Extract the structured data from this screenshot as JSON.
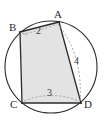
{
  "figure": {
    "type": "geometry-diagram",
    "canvas": {
      "width": 107,
      "height": 131
    },
    "colors": {
      "stroke": "#2b2b2b",
      "fill": "#e2e2e2",
      "dashed": "#9a9a9a",
      "background": "#ffffff"
    },
    "circle": {
      "name": "circumscribed-circle",
      "cx": 51,
      "cy": 67,
      "r": 46
    },
    "vertices": [
      {
        "id": "A",
        "label": "A",
        "x": 59,
        "y": 22
      },
      {
        "id": "B",
        "label": "B",
        "x": 20,
        "y": 32
      },
      {
        "id": "C",
        "label": "C",
        "x": 22,
        "y": 103
      },
      {
        "id": "D",
        "label": "D",
        "x": 81,
        "y": 103
      }
    ],
    "quadrilateral": {
      "name": "quadrilateral-ABCD",
      "order": [
        "A",
        "B",
        "C",
        "D"
      ],
      "filled": true
    },
    "measures": [
      {
        "id": "m2",
        "value": "2",
        "applies_to": "BA",
        "x": 38,
        "y": 30
      },
      {
        "id": "m4",
        "value": "4",
        "applies_to": "AD",
        "x": 76,
        "y": 60
      },
      {
        "id": "m3",
        "value": "3",
        "applies_to": "CD",
        "x": 49,
        "y": 92
      }
    ],
    "dashed_guides": [
      {
        "id": "guide-BA",
        "from": "B",
        "to": "A",
        "style": "dashed"
      },
      {
        "id": "guide-AD",
        "from": "A",
        "to": "D",
        "style": "dashed-arc"
      },
      {
        "id": "guide-CD",
        "from": "C",
        "to": "D",
        "style": "dashed-arc"
      }
    ]
  }
}
